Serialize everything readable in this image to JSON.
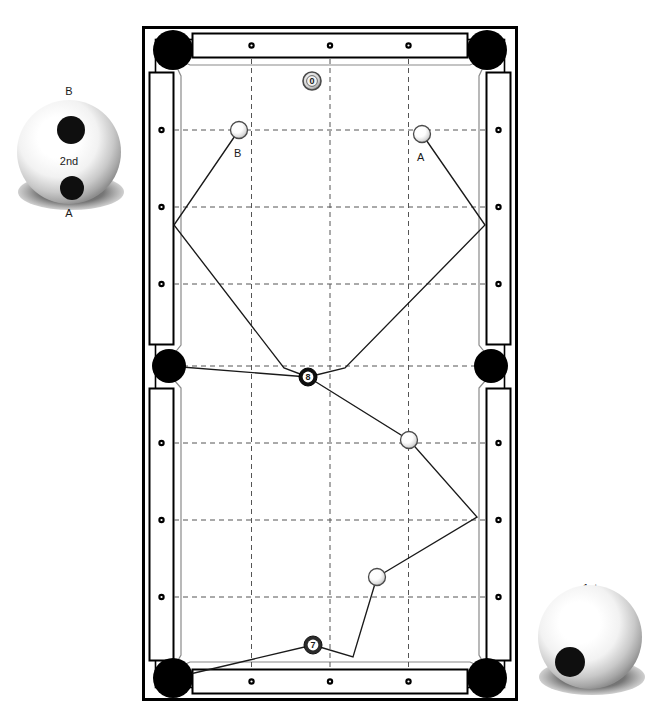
{
  "diagram": {
    "table": {
      "outer_frame": {
        "x": 143,
        "y": 27,
        "width": 374,
        "height": 673,
        "stroke": "#000000",
        "fill": "#ffffff"
      },
      "rail_color": "#ffffff",
      "rail_stroke": "#000000",
      "cloth_color": "#ffffff",
      "playfield": {
        "x": 173,
        "y": 57,
        "width": 314,
        "height": 613
      },
      "grid_color": "#4a4a4a",
      "grid_style": "dashed",
      "grid_columns": 4,
      "grid_rows": 8,
      "pocket_color": "#000000",
      "diamond_color": "#000000",
      "diamonds_long_rail": 3,
      "diamonds_side_rail": 3
    },
    "pockets": [
      {
        "name": "top-left",
        "cx": 173,
        "cy": 50,
        "r": 20
      },
      {
        "name": "top-right",
        "cx": 487,
        "cy": 50,
        "r": 20
      },
      {
        "name": "middle-left",
        "cx": 169,
        "cy": 366,
        "r": 17
      },
      {
        "name": "middle-right",
        "cx": 491,
        "cy": 366,
        "r": 17
      },
      {
        "name": "bottom-left",
        "cx": 173,
        "cy": 678,
        "r": 20
      },
      {
        "name": "bottom-right",
        "cx": 487,
        "cy": 678,
        "r": 20
      }
    ],
    "balls": [
      {
        "id": "ball-0",
        "label": "0",
        "cx": 312,
        "cy": 81,
        "r": 9,
        "type": "numbered-light",
        "caption": ""
      },
      {
        "id": "ball-B",
        "label": "",
        "cx": 239,
        "cy": 130,
        "r": 8.5,
        "type": "cue",
        "caption": "B",
        "caption_dx": -5,
        "caption_dy": 24
      },
      {
        "id": "ball-A",
        "label": "",
        "cx": 422,
        "cy": 134,
        "r": 8.5,
        "type": "cue",
        "caption": "A",
        "caption_dx": -5,
        "caption_dy": 24
      },
      {
        "id": "ball-8",
        "label": "8",
        "cx": 308,
        "cy": 377,
        "r": 9,
        "type": "numbered-dark",
        "caption": ""
      },
      {
        "id": "ball-mid",
        "label": "",
        "cx": 409,
        "cy": 440,
        "r": 8.5,
        "type": "cue",
        "caption": ""
      },
      {
        "id": "ball-low",
        "label": "",
        "cx": 377,
        "cy": 577,
        "r": 8.5,
        "type": "cue",
        "caption": ""
      },
      {
        "id": "ball-7",
        "label": "7",
        "cx": 313,
        "cy": 645,
        "r": 9,
        "type": "numbered-dark",
        "caption": ""
      }
    ],
    "paths": [
      {
        "name": "path-B-bank",
        "points": "239,130 174,225 284,368 308,377"
      },
      {
        "name": "path-A-bank",
        "points": "422,134 485,225 345,368 308,377"
      },
      {
        "name": "path-8-to-side-pocket",
        "points": "308,377 169,366"
      },
      {
        "name": "path-8-down",
        "points": "308,377 409,440 477,517 377,577"
      },
      {
        "name": "path-7-bank",
        "points": "377,577 353,657 313,645"
      },
      {
        "name": "path-7-to-corner",
        "points": "313,645 173,678"
      }
    ],
    "legend_balls": [
      {
        "id": "legend-2nd",
        "label": "2nd",
        "top_label": "B",
        "bottom_label": "A",
        "cx": 69,
        "cy": 152,
        "r": 52,
        "contacts": [
          {
            "cx": 71,
            "cy": 130,
            "r": 14
          },
          {
            "cx": 72,
            "cy": 188,
            "r": 12
          }
        ]
      },
      {
        "id": "legend-1st",
        "label": "",
        "top_label": "1st",
        "bottom_label": "",
        "cx": 590,
        "cy": 637,
        "r": 52,
        "contacts": [
          {
            "cx": 570,
            "cy": 662,
            "r": 15
          }
        ]
      }
    ],
    "labels": {
      "order_second": "2nd",
      "order_first": "1st",
      "point_a": "A",
      "point_b": "B"
    }
  }
}
